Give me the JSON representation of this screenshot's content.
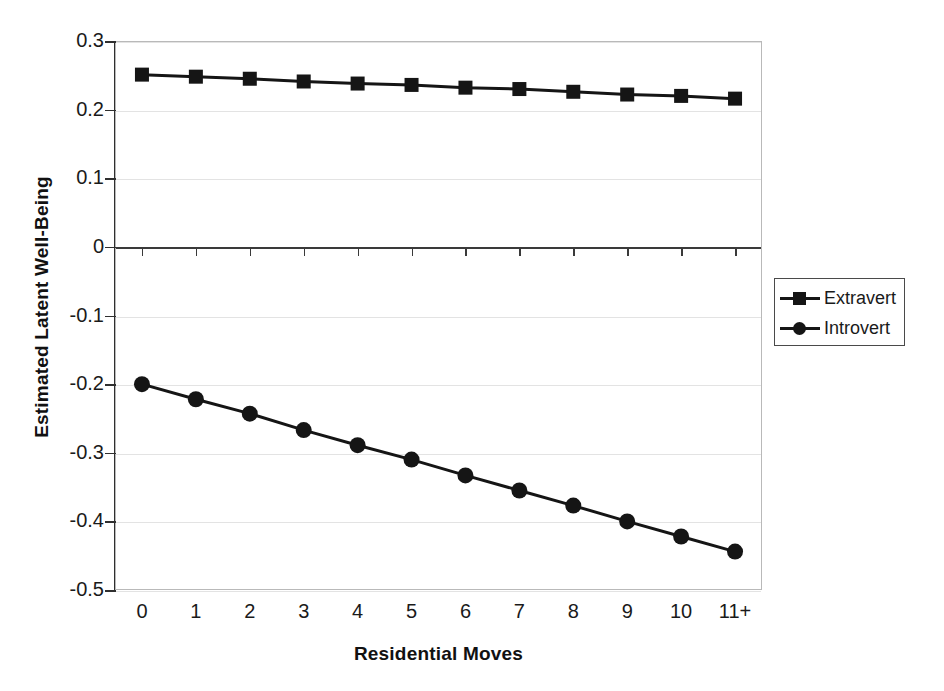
{
  "chart_data": {
    "type": "line",
    "title": "",
    "xlabel": "Residential Moves",
    "ylabel": "Estimated Latent Well-Being",
    "categories": [
      "0",
      "1",
      "2",
      "3",
      "4",
      "5",
      "6",
      "7",
      "8",
      "9",
      "10",
      "11+"
    ],
    "ylim": [
      -0.5,
      0.3
    ],
    "yticks": [
      "0.3",
      "0.2",
      "0.1",
      "0",
      "-0.1",
      "-0.2",
      "-0.3",
      "-0.4",
      "-0.5"
    ],
    "ytick_values": [
      0.3,
      0.2,
      0.1,
      0,
      -0.1,
      -0.2,
      -0.3,
      -0.4,
      -0.5
    ],
    "grid": true,
    "legend_position": "right",
    "series": [
      {
        "name": "Extravert",
        "marker": "square",
        "color": "#151515",
        "values": [
          0.251,
          0.248,
          0.245,
          0.241,
          0.238,
          0.236,
          0.232,
          0.23,
          0.226,
          0.222,
          0.22,
          0.216
        ]
      },
      {
        "name": "Introvert",
        "marker": "circle",
        "color": "#151515",
        "values": [
          -0.2,
          -0.222,
          -0.243,
          -0.267,
          -0.289,
          -0.31,
          -0.333,
          -0.355,
          -0.377,
          -0.4,
          -0.422,
          -0.444
        ]
      }
    ]
  },
  "legend": {
    "items": [
      {
        "label": "Extravert",
        "marker": "square"
      },
      {
        "label": "Introvert",
        "marker": "circle"
      }
    ]
  }
}
